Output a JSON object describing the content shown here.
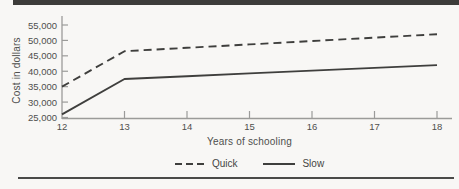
{
  "figure": {
    "background": "#f8f7f5",
    "top_bar_color": "#3d3c3a",
    "bottom_rule_color": "#4a4a48",
    "axis_color": "#9b9b99",
    "line_color": "#3f3f3d",
    "text_color": "#4f4f4d"
  },
  "chart_data": {
    "type": "line",
    "title": "",
    "xlabel": "Years of schooling",
    "ylabel": "Cost in dollars",
    "x": [
      12,
      13,
      14,
      15,
      16,
      17,
      18
    ],
    "xlim": [
      12,
      18
    ],
    "ylim": [
      25000,
      55000
    ],
    "x_ticks": [
      12,
      13,
      14,
      15,
      16,
      17,
      18
    ],
    "x_tick_labels": [
      "12",
      "13",
      "14",
      "15",
      "16",
      "17",
      "18"
    ],
    "y_ticks": [
      25000,
      30000,
      35000,
      40000,
      45000,
      50000,
      55000
    ],
    "y_tick_labels": [
      "25,000",
      "30,000",
      "35,000",
      "40,000",
      "45,000",
      "50,000",
      "55,000"
    ],
    "grid": false,
    "legend_position": "bottom-center",
    "series": [
      {
        "name": "Quick",
        "style": "dashed",
        "color": "#3f3f3d",
        "values": [
          35000,
          46500,
          47600,
          48700,
          49800,
          50900,
          52000
        ]
      },
      {
        "name": "Slow",
        "style": "solid",
        "color": "#3f3f3d",
        "values": [
          26000,
          37500,
          38400,
          39300,
          40200,
          41100,
          42000
        ]
      }
    ]
  }
}
